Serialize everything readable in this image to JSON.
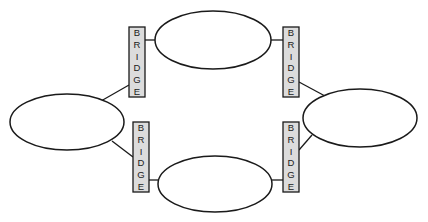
{
  "diagram": {
    "title": "",
    "lans": [
      {
        "id": "lan-top",
        "cx": 213,
        "cy": 40,
        "rx": 58,
        "ry": 29,
        "label": ""
      },
      {
        "id": "lan-left",
        "cx": 67,
        "cy": 122,
        "rx": 57,
        "ry": 28,
        "label": ""
      },
      {
        "id": "lan-right",
        "cx": 360,
        "cy": 118,
        "rx": 57,
        "ry": 29,
        "label": ""
      },
      {
        "id": "lan-bottom",
        "cx": 215,
        "cy": 184,
        "rx": 57,
        "ry": 28,
        "label": ""
      }
    ],
    "bridges": [
      {
        "id": "bridge-top-left",
        "x": 129,
        "y": 27,
        "w": 16,
        "h": 70,
        "letters": [
          "B",
          "R",
          "I",
          "D",
          "G",
          "E"
        ]
      },
      {
        "id": "bridge-top-right",
        "x": 283,
        "y": 27,
        "w": 16,
        "h": 70,
        "letters": [
          "B",
          "R",
          "I",
          "D",
          "G",
          "E"
        ]
      },
      {
        "id": "bridge-bottom-left",
        "x": 133,
        "y": 122,
        "w": 16,
        "h": 70,
        "letters": [
          "B",
          "R",
          "I",
          "D",
          "G",
          "E"
        ]
      },
      {
        "id": "bridge-bottom-right",
        "x": 283,
        "y": 122,
        "w": 16,
        "h": 70,
        "letters": [
          "B",
          "R",
          "I",
          "D",
          "G",
          "E"
        ]
      }
    ],
    "links": [
      {
        "from": "bridge-top-left",
        "to": "lan-top",
        "x1": 145,
        "y1": 40,
        "x2": 155,
        "y2": 40
      },
      {
        "from": "bridge-top-left",
        "to": "lan-left",
        "x1": 129,
        "y1": 85,
        "x2": 101,
        "y2": 101
      },
      {
        "from": "bridge-top-right",
        "to": "lan-top",
        "x1": 271,
        "y1": 40,
        "x2": 283,
        "y2": 40
      },
      {
        "from": "bridge-top-right",
        "to": "lan-right",
        "x1": 299,
        "y1": 82,
        "x2": 325,
        "y2": 96
      },
      {
        "from": "bridge-bottom-left",
        "to": "lan-left",
        "x1": 112,
        "y1": 141,
        "x2": 133,
        "y2": 157
      },
      {
        "from": "bridge-bottom-left",
        "to": "lan-bottom",
        "x1": 149,
        "y1": 180,
        "x2": 159,
        "y2": 180
      },
      {
        "from": "bridge-bottom-right",
        "to": "lan-bottom",
        "x1": 271,
        "y1": 180,
        "x2": 283,
        "y2": 180
      },
      {
        "from": "bridge-bottom-right",
        "to": "lan-right",
        "x1": 299,
        "y1": 150,
        "x2": 312,
        "y2": 135
      }
    ],
    "colors": {
      "stroke": "#1a1a1a",
      "bridge_fill": "#dcdcdc",
      "lan_fill": "#ffffff",
      "background": "#ffffff"
    }
  }
}
